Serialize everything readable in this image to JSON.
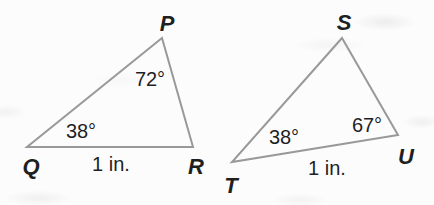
{
  "figure": {
    "triangle_left": {
      "vertex_top": "P",
      "vertex_bottom_left": "Q",
      "vertex_bottom_right": "R",
      "angle_at_p": "72°",
      "angle_at_q": "38°",
      "side_qr_label": "1 in."
    },
    "triangle_right": {
      "vertex_top": "S",
      "vertex_bottom_left": "T",
      "vertex_bottom_right": "U",
      "angle_at_t": "38°",
      "angle_at_u": "67°",
      "side_tu_label": "1 in."
    },
    "colors": {
      "line": "#999999",
      "text": "#1f1f1f",
      "background": "#fcfcfc"
    }
  }
}
